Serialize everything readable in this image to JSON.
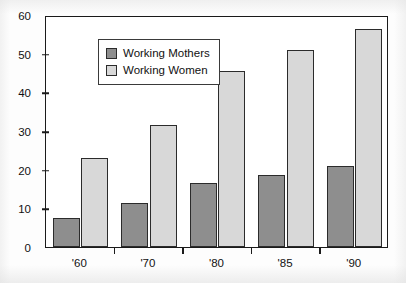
{
  "chart_data": {
    "type": "bar",
    "title": "",
    "xlabel": "",
    "ylabel": "",
    "categories": [
      "'60",
      "'70",
      "'80",
      "'85",
      "'90"
    ],
    "series": [
      {
        "name": "Working Mothers",
        "color": "#8e8e8e",
        "values": [
          7.5,
          11.5,
          16.5,
          18.5,
          21
        ]
      },
      {
        "name": "Working Women",
        "color": "#d8d8d8",
        "values": [
          23,
          31.5,
          45.5,
          51,
          56.5
        ]
      }
    ],
    "ylim": [
      0,
      60
    ],
    "yticks": [
      0,
      10,
      20,
      30,
      40,
      50,
      60
    ],
    "ytick_labels": [
      "0",
      "10",
      "20",
      "30",
      "40",
      "50",
      "60"
    ],
    "grid": false,
    "legend_position": "top-left"
  },
  "legend": {
    "items": [
      {
        "label": "Working Mothers",
        "swatch": "mothers"
      },
      {
        "label": "Working Women",
        "swatch": "women"
      }
    ]
  },
  "colors": {
    "mothers": "#8e8e8e",
    "women": "#d8d8d8",
    "axis": "#1a1a1a",
    "bar_border": "#2b2b2b"
  }
}
